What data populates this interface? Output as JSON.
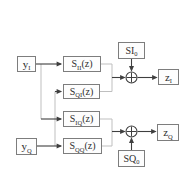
{
  "figure": {
    "type": "block-diagram",
    "background_color": "#ffffff",
    "box_border_color": "#7d7d7d",
    "dark_line_color": "#3f3f3f",
    "light_line_color": "#bfbfbf",
    "text_color": "#2e2e2e"
  },
  "nodes": {
    "y_i": {
      "base": "y",
      "sub": "I"
    },
    "y_q": {
      "base": "y",
      "sub": "Q"
    },
    "s_ii": {
      "base": "S",
      "sub": "II",
      "suffix": "(z)"
    },
    "s_qi": {
      "base": "S",
      "sub": "QI",
      "suffix": "(z)"
    },
    "s_iq": {
      "base": "S",
      "sub": "IQ",
      "suffix": "(z)"
    },
    "s_qq": {
      "base": "S",
      "sub": "QQ",
      "suffix": "(z)"
    },
    "si_0": {
      "base": "SI",
      "sub": "0"
    },
    "sq_0": {
      "base": "SQ",
      "sub": "0"
    },
    "z_i": {
      "base": "z",
      "sub": "I"
    },
    "z_q": {
      "base": "z",
      "sub": "Q"
    },
    "adder_i": {
      "symbol": "+"
    },
    "adder_q": {
      "symbol": "+"
    }
  },
  "connections": [
    "y_I -> S_II(z)",
    "y_I -> S_IQ(z)",
    "y_Q -> S_QI(z)",
    "y_Q -> S_QQ(z)",
    "S_II(z) -> adder_I",
    "S_QI(z) -> adder_I",
    "SI_0 -> adder_I",
    "adder_I -> z_I",
    "S_IQ(z) -> adder_Q",
    "S_QQ(z) -> adder_Q",
    "SQ_0 -> adder_Q",
    "adder_Q -> z_Q"
  ]
}
